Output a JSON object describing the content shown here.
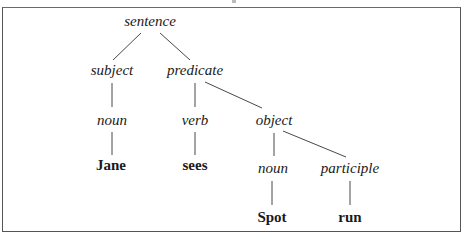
{
  "diagram": {
    "type": "syntax-tree",
    "nodes": {
      "sentence": {
        "label": "sentence",
        "kind": "category"
      },
      "subject": {
        "label": "subject",
        "kind": "category"
      },
      "predicate": {
        "label": "predicate",
        "kind": "category"
      },
      "noun1": {
        "label": "noun",
        "kind": "category"
      },
      "verb": {
        "label": "verb",
        "kind": "category"
      },
      "object": {
        "label": "object",
        "kind": "category"
      },
      "noun2": {
        "label": "noun",
        "kind": "category"
      },
      "participle": {
        "label": "participle",
        "kind": "category"
      },
      "jane": {
        "label": "Jane",
        "kind": "word"
      },
      "sees": {
        "label": "sees",
        "kind": "word"
      },
      "spot": {
        "label": "Spot",
        "kind": "word"
      },
      "run": {
        "label": "run",
        "kind": "word"
      }
    },
    "edges": [
      [
        "sentence",
        "subject"
      ],
      [
        "sentence",
        "predicate"
      ],
      [
        "subject",
        "noun1"
      ],
      [
        "predicate",
        "verb"
      ],
      [
        "predicate",
        "object"
      ],
      [
        "noun1",
        "jane"
      ],
      [
        "verb",
        "sees"
      ],
      [
        "object",
        "noun2"
      ],
      [
        "object",
        "participle"
      ],
      [
        "noun2",
        "spot"
      ],
      [
        "participle",
        "run"
      ]
    ],
    "colors": {
      "line": "#333333",
      "text": "#1a1a1a",
      "frame": "#555555",
      "background": "#ffffff"
    }
  }
}
